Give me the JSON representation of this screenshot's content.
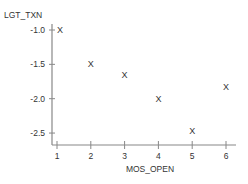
{
  "chart_data": {
    "type": "scatter",
    "title": "",
    "xlabel": "MOS_OPEN",
    "ylabel": "LGT_TXN",
    "marker": "X",
    "x": [
      1,
      2,
      3,
      4,
      5,
      6
    ],
    "y": [
      -1.0,
      -1.5,
      -1.65,
      -2.0,
      -2.47,
      -1.83
    ],
    "xticks": [
      "1",
      "2",
      "3",
      "4",
      "5",
      "6"
    ],
    "yticks": [
      "-1.0",
      "-1.5",
      "-2.0",
      "-2.5"
    ],
    "xlim": [
      0.85,
      6.4
    ],
    "ylim": [
      -2.65,
      -1.0
    ],
    "grid": false,
    "legend": null
  },
  "colors": {
    "axis": "#888888",
    "text": "#333333",
    "background": "#ffffff"
  }
}
